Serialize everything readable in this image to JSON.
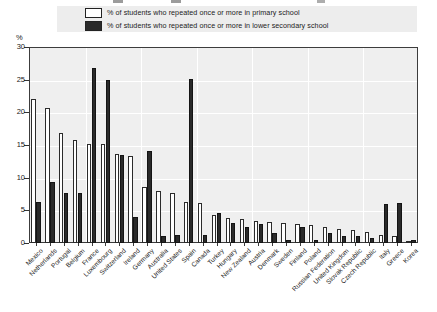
{
  "legend": {
    "items": [
      {
        "label": "% of students who repeated once or more in primary school",
        "swatch": "white-square-icon",
        "color": "#ffffff"
      },
      {
        "label": "% of students who repeated once or more in lower secondary school",
        "swatch": "black-square-icon",
        "color": "#2a2a2a"
      }
    ]
  },
  "axis": {
    "y_unit": "%",
    "y_ticks": [
      "0",
      "5",
      "10",
      "15",
      "20",
      "25",
      "30"
    ]
  },
  "chart_data": {
    "type": "bar",
    "title": "",
    "subtitle": "",
    "xlabel": "",
    "ylabel": "%",
    "ylim": [
      0,
      30
    ],
    "ytick_step": 5,
    "grid": true,
    "legend_position": "top",
    "orientation": "vertical",
    "categories": [
      "Mexico",
      "Netherlands",
      "Portugal",
      "Belgium",
      "France",
      "Luxembourg",
      "Switzerland",
      "Ireland",
      "Germany",
      "Australia",
      "United States",
      "Spain",
      "Canada",
      "Turkey",
      "Hungary",
      "New Zealand",
      "Austria",
      "Denmark",
      "Sweden",
      "Finland",
      "Poland",
      "Russian Federation",
      "United Kingdom",
      "Slovak Republic",
      "Czech Republic",
      "Italy",
      "Greece",
      "Korea"
    ],
    "series": [
      {
        "name": "% of students who repeated once or more in primary school",
        "color": "#ffffff",
        "values": [
          22.0,
          20.6,
          16.8,
          15.7,
          15.2,
          15.2,
          13.7,
          13.3,
          8.5,
          7.9,
          7.6,
          6.3,
          6.1,
          4.3,
          3.8,
          3.6,
          3.4,
          3.2,
          3.1,
          2.9,
          2.8,
          2.5,
          2.2,
          2.0,
          1.7,
          1.3,
          1.1,
          0.3
        ]
      },
      {
        "name": "% of students who repeated once or more in lower secondary school",
        "color": "#2a2a2a",
        "values": [
          6.3,
          9.4,
          7.6,
          7.6,
          26.8,
          25.0,
          13.4,
          4.0,
          14.1,
          1.1,
          1.2,
          25.1,
          1.3,
          4.6,
          3.1,
          2.4,
          2.9,
          1.5,
          0.5,
          2.5,
          0.5,
          1.6,
          1.1,
          1.0,
          0.8,
          5.9,
          6.1,
          0.4
        ]
      }
    ]
  }
}
